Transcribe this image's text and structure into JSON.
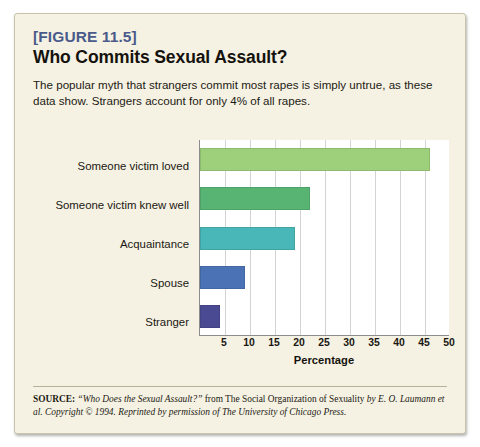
{
  "figure": {
    "number": "[FIGURE 11.5]",
    "title": "Who Commits Sexual Assault?",
    "description": "The popular myth that strangers commit most rapes is simply untrue, as these data show. Strangers account for only 4% of all rapes.",
    "source_label": "SOURCE:",
    "source_quote": "“Who Does the Sexual Assault?”",
    "source_from": " from The Social Organization of Sexuality ",
    "source_authors": "by E. O. Laumann et al. Copyright © 1994. Reprinted by permission of The University of Chicago Press."
  },
  "chart_data": {
    "type": "bar",
    "orientation": "horizontal",
    "title": "Who Commits Sexual Assault?",
    "xlabel": "Percentage",
    "ylabel": "",
    "xlim": [
      0,
      50
    ],
    "xticks": [
      0,
      5,
      10,
      15,
      20,
      25,
      30,
      35,
      40,
      45,
      50
    ],
    "xtick_labels": [
      "",
      "5",
      "10",
      "15",
      "20",
      "25",
      "30",
      "35",
      "40",
      "45",
      "50"
    ],
    "grid": "vertical",
    "legend": "none",
    "categories": [
      "Someone victim loved",
      "Someone victim knew well",
      "Acquaintance",
      "Spouse",
      "Stranger"
    ],
    "values": [
      46,
      22,
      19,
      9,
      4
    ],
    "colors": [
      "#9ed07c",
      "#57b473",
      "#49b7b7",
      "#4a72b5",
      "#4a4a93"
    ]
  },
  "colors": {
    "panel_background": "#f5f2e3",
    "plot_background": "#ffffff",
    "figure_number": "#4a5a8a",
    "axis": "#8d8d8d",
    "gridline": "#d3d3d3"
  }
}
